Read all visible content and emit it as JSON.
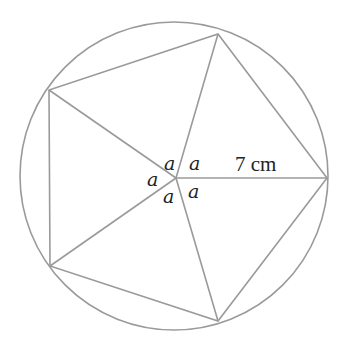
{
  "diagram": {
    "type": "inscribed-pentagon-in-circle",
    "stroke_color": "#9a9a9a",
    "text_color": "#222222",
    "circle": {
      "cx": 174,
      "cy": 176,
      "r": 154
    },
    "center": {
      "x": 176,
      "y": 178
    },
    "vertices": [
      {
        "x": 327,
        "y": 178
      },
      {
        "x": 218,
        "y": 34
      },
      {
        "x": 49,
        "y": 90
      },
      {
        "x": 50,
        "y": 266
      },
      {
        "x": 218,
        "y": 321
      }
    ],
    "angle_labels": [
      "a",
      "a",
      "a",
      "a",
      "a"
    ],
    "radius_label": "7 cm"
  }
}
